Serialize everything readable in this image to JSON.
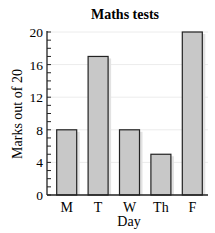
{
  "chart_data": {
    "type": "bar",
    "title": "Maths tests",
    "xlabel": "Day",
    "ylabel": "Marks out of 20",
    "categories": [
      "M",
      "T",
      "W",
      "Th",
      "F"
    ],
    "values": [
      8,
      17,
      8,
      5,
      20
    ],
    "ylim": [
      0,
      20
    ],
    "yticks": [
      0,
      4,
      8,
      12,
      16,
      20
    ],
    "minor_tick_step": 1,
    "grid": true,
    "legend": null,
    "colors": {
      "bar_fill": "#c8c8c8",
      "bar_edge": "#222222",
      "bar_shadow": "#e2e2e2",
      "grid": "#ececec"
    }
  }
}
